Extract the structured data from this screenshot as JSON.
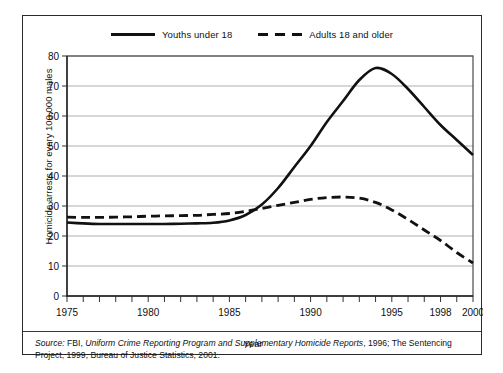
{
  "legend": {
    "entries": [
      {
        "label": "Youths under 18",
        "style": "solid",
        "color": "#111111"
      },
      {
        "label": "Adults 18 and older",
        "style": "dashed",
        "color": "#111111"
      }
    ]
  },
  "source_note": {
    "label": "Source:",
    "text_part1": " FBI, ",
    "title": "Uniform Crime Reporting Program and Supplementary Homicide Reports",
    "text_part2": ", 1996; The Sentencing Project, 1999, Bureau of Justice Statistics, 2001."
  },
  "chart_data": {
    "type": "line",
    "title": "",
    "xlabel": "Year",
    "ylabel": "Homicide arrests for every 100,000 males",
    "xlim": [
      1975,
      2000
    ],
    "ylim": [
      0,
      80
    ],
    "ytick_labels": [
      "0",
      "10",
      "20",
      "30",
      "40",
      "50",
      "60",
      "70",
      "80"
    ],
    "yticks": [
      0,
      10,
      20,
      30,
      40,
      50,
      60,
      70,
      80
    ],
    "xtick_labels": [
      "1975",
      "1980",
      "1985",
      "1990",
      "1995",
      "1998",
      "2000"
    ],
    "xticks": [
      1975,
      1980,
      1985,
      1990,
      1995,
      1998,
      2000
    ],
    "minor_xticks_every": 1,
    "grid": "horizontal",
    "legend_position": "top-center",
    "x": [
      1975,
      1976,
      1977,
      1978,
      1979,
      1980,
      1981,
      1982,
      1983,
      1984,
      1985,
      1986,
      1987,
      1988,
      1989,
      1990,
      1991,
      1992,
      1993,
      1994,
      1995,
      1996,
      1997,
      1998,
      1999,
      2000
    ],
    "series": [
      {
        "name": "Youths under 18",
        "style": "solid",
        "color": "#111111",
        "values": [
          24.5,
          24.2,
          24.0,
          24.0,
          24.0,
          24.0,
          24.0,
          24.1,
          24.2,
          24.4,
          25.2,
          27.0,
          30.5,
          36.0,
          43.0,
          50.0,
          58.0,
          65.0,
          72.0,
          76.0,
          74.0,
          69.0,
          63.0,
          57.0,
          52.0,
          47.0
        ]
      },
      {
        "name": "Adults 18 and older",
        "style": "dashed",
        "color": "#111111",
        "values": [
          26.3,
          26.2,
          26.2,
          26.3,
          26.4,
          26.6,
          26.7,
          26.8,
          26.9,
          27.2,
          27.5,
          28.2,
          29.2,
          30.2,
          31.2,
          32.2,
          32.8,
          33.0,
          32.6,
          31.2,
          28.7,
          25.5,
          22.0,
          18.5,
          14.5,
          11.0
        ]
      }
    ]
  }
}
